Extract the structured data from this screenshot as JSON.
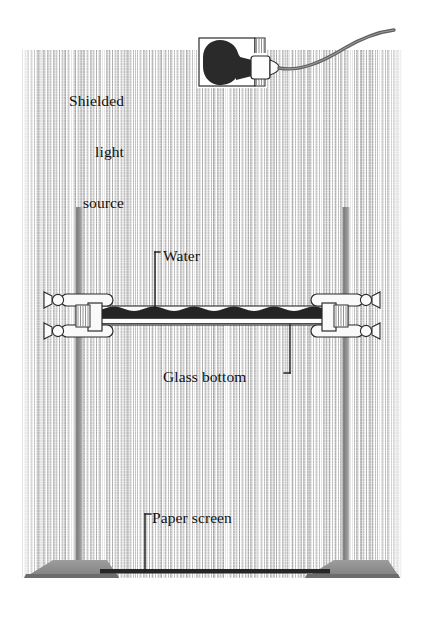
{
  "figure": {
    "type": "line-illustration",
    "background": "#ffffff",
    "ink_color": "#1a1a1a",
    "hatching": "vertical-line-texture"
  },
  "labels": {
    "light_source": "Shielded\nlight\nsource",
    "light_source_line1": "Shielded",
    "light_source_line2": "light",
    "light_source_line3": "source",
    "water": "Water",
    "glass_bottom": "Glass bottom",
    "paper_screen": "Paper screen"
  },
  "parts": {
    "bulb": "light-bulb",
    "shield_box": "lamp-shield-housing",
    "cord": "power-cord",
    "left_stand": "left-support-stand",
    "right_stand": "right-support-stand",
    "left_clamp": "left-clamp",
    "right_clamp": "right-clamp",
    "tank": "glass-bottom-tray",
    "water_surface": "rippled-water-surface",
    "screen": "paper-screen-board",
    "left_base": "left-stand-base",
    "right_base": "right-stand-base"
  },
  "colors": {
    "ink": "#1a1a1a",
    "stand_gray": "#8a8a8a",
    "stand_dark": "#6e6e6e",
    "water_dark": "#262626",
    "glass_light": "#f2f2f2",
    "cord_gray": "#6d6d6d",
    "hatch_gray": "#9a9a9a"
  },
  "geometry": {
    "canvas_width": 423,
    "canvas_height": 620,
    "hatch_left": 22,
    "hatch_right": 402,
    "hatch_top": 50,
    "hatch_bottom": 578,
    "tank_left": 82,
    "tank_right": 340,
    "tank_top": 307,
    "tank_bottom": 325,
    "screen_y": 572,
    "screen_left": 100,
    "screen_right": 330
  }
}
